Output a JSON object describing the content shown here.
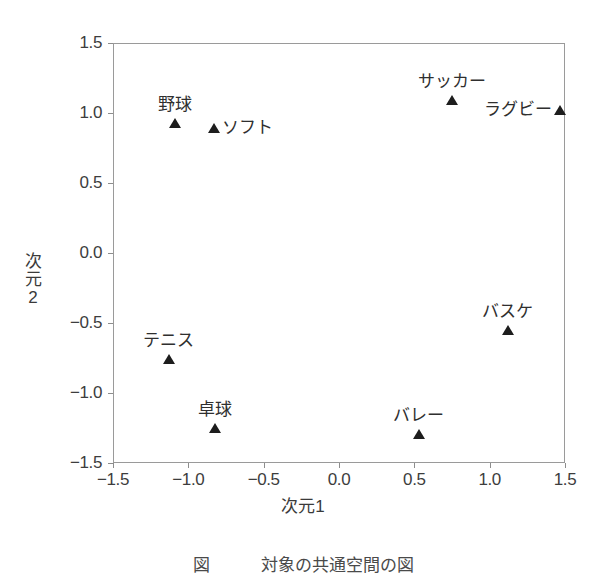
{
  "chart_data": {
    "type": "scatter",
    "title": "",
    "xlabel": "次元1",
    "ylabel": "次元2",
    "xlim": [
      -1.5,
      1.5
    ],
    "ylim": [
      -1.5,
      1.5
    ],
    "xticks": [
      "−1.5",
      "−1.0",
      "−0.5",
      "0.0",
      "0.5",
      "1.0",
      "1.5"
    ],
    "xtick_values": [
      -1.5,
      -1.0,
      -0.5,
      0.0,
      0.5,
      1.0,
      1.5
    ],
    "yticks": [
      "1.5",
      "1.0",
      "0.5",
      "0.0",
      "−0.5",
      "−1.0",
      "−1.5"
    ],
    "ytick_values": [
      1.5,
      1.0,
      0.5,
      0.0,
      -0.5,
      -1.0,
      -1.5
    ],
    "grid": false,
    "legend": false,
    "marker": "triangle-up",
    "marker_color": "#1d1d1d",
    "frame_color": "#9a9a9a",
    "points": [
      {
        "label": "野球",
        "x": -1.09,
        "y": 0.93,
        "label_pos": "above"
      },
      {
        "label": "ソフト",
        "x": -0.83,
        "y": 0.89,
        "label_pos": "right"
      },
      {
        "label": "サッカー",
        "x": 0.75,
        "y": 1.09,
        "label_pos": "above"
      },
      {
        "label": "ラグビー",
        "x": 1.47,
        "y": 1.02,
        "label_pos": "left"
      },
      {
        "label": "バスケ",
        "x": 1.12,
        "y": -0.55,
        "label_pos": "above"
      },
      {
        "label": "テニス",
        "x": -1.13,
        "y": -0.76,
        "label_pos": "above"
      },
      {
        "label": "卓球",
        "x": -0.82,
        "y": -1.25,
        "label_pos": "above"
      },
      {
        "label": "バレー",
        "x": 0.53,
        "y": -1.29,
        "label_pos": "above"
      }
    ]
  },
  "ylabel_chars": [
    "次",
    "元",
    "2"
  ],
  "caption": "図　　　対象の共通空間の図"
}
